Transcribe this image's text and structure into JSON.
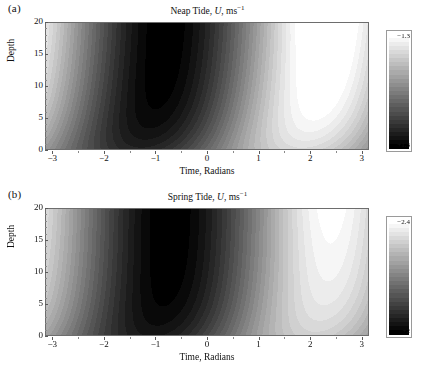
{
  "figure": {
    "width": 423,
    "height": 380,
    "background": "#ffffff"
  },
  "chart_data": [
    {
      "type": "heatmap",
      "panel_tag": "(a)",
      "title": "Neap Tide, U, ms",
      "title_variable": "U",
      "title_units_exponent": "−1",
      "xlabel": "Time, Radians",
      "ylabel": "Depth",
      "xticks": [
        -3,
        -2,
        -1,
        0,
        1,
        2,
        3
      ],
      "xtick_labels": [
        "−3",
        "−2",
        "−1",
        "0",
        "1",
        "2",
        "3"
      ],
      "yticks": [
        0,
        5,
        10,
        15,
        20
      ],
      "ytick_labels": [
        "0",
        "5",
        "10",
        "15",
        "20"
      ],
      "xlim": [
        -3.14159,
        3.14159
      ],
      "ylim": [
        0,
        20
      ],
      "grid": false,
      "colorbar": {
        "label_top": "−1.3",
        "label_bottom": "+1.3",
        "vmin": -1.3,
        "vmax": 1.3,
        "top_color": "#ffffff",
        "bottom_color": "#000000",
        "orientation": "vertical",
        "position": "right"
      },
      "field": {
        "amplitude": 1.3,
        "phase_offset": -0.75,
        "surface_phase_lag": 0.55,
        "shear_decay": 0.42,
        "bottom_damping": 0.3,
        "positive_lobe_center_x": -0.8,
        "positive_lobe_center_y": 6,
        "negative_lobe_center_x": 2.35,
        "negative_lobe_center_y": 16,
        "contour_levels": 28
      }
    },
    {
      "type": "heatmap",
      "panel_tag": "(b)",
      "title": "Spring Tide, U, ms",
      "title_variable": "U",
      "title_units_exponent": "−1",
      "xlabel": "Time, Radians",
      "ylabel": "Depth",
      "xticks": [
        -3,
        -2,
        -1,
        0,
        1,
        2,
        3
      ],
      "xtick_labels": [
        "−3",
        "−2",
        "−1",
        "0",
        "1",
        "2",
        "3"
      ],
      "yticks": [
        0,
        5,
        10,
        15,
        20
      ],
      "ytick_labels": [
        "0",
        "5",
        "10",
        "15",
        "20"
      ],
      "xlim": [
        -3.14159,
        3.14159
      ],
      "ylim": [
        0,
        20
      ],
      "grid": false,
      "colorbar": {
        "label_top": "−2.4",
        "label_bottom": "+2",
        "vmin": -2.4,
        "vmax": 2.0,
        "top_color": "#ffffff",
        "bottom_color": "#000000",
        "orientation": "vertical",
        "position": "right"
      },
      "field": {
        "amplitude": 2.0,
        "phase_offset": -0.7,
        "surface_phase_lag": 0.35,
        "shear_decay": 0.3,
        "bottom_damping": 0.22,
        "positive_lobe_center_x": -0.75,
        "positive_lobe_center_y": 8,
        "negative_lobe_center_x": 2.4,
        "negative_lobe_center_y": 14,
        "contour_levels": 28
      }
    }
  ]
}
